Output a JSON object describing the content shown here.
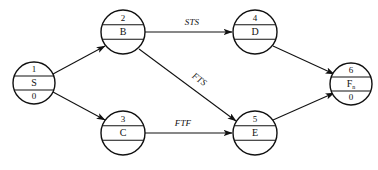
{
  "diagram": {
    "type": "precedence-network-diagram",
    "width": 378,
    "height": 170,
    "background_color": "#ffffff",
    "line_color": "#111111",
    "nodes": [
      {
        "id": "1",
        "name": "S",
        "duration": "0",
        "subscript": "",
        "cx": 34,
        "cy": 83,
        "r": 21
      },
      {
        "id": "2",
        "name": "B",
        "duration": "",
        "subscript": "",
        "cx": 123,
        "cy": 32,
        "r": 22
      },
      {
        "id": "3",
        "name": "C",
        "duration": "",
        "subscript": "",
        "cx": 123,
        "cy": 133,
        "r": 22
      },
      {
        "id": "4",
        "name": "D",
        "duration": "",
        "subscript": "",
        "cx": 255,
        "cy": 32,
        "r": 22
      },
      {
        "id": "5",
        "name": "E",
        "duration": "",
        "subscript": "",
        "cx": 255,
        "cy": 133,
        "r": 22
      },
      {
        "id": "6",
        "name": "F",
        "duration": "0",
        "subscript": "n",
        "cx": 351,
        "cy": 84,
        "r": 21
      }
    ],
    "edges": [
      {
        "from": "1",
        "to": "2",
        "label": "",
        "x1": 53,
        "y1": 74,
        "x2": 105,
        "y2": 46,
        "label_x": 0,
        "label_y": 0,
        "label_rotate": 0
      },
      {
        "from": "1",
        "to": "3",
        "label": "",
        "x1": 53,
        "y1": 92,
        "x2": 105,
        "y2": 120,
        "label_x": 0,
        "label_y": 0,
        "label_rotate": 0
      },
      {
        "from": "2",
        "to": "4",
        "label": "STS",
        "x1": 145,
        "y1": 32,
        "x2": 232,
        "y2": 32,
        "label_x": 192,
        "label_y": 23,
        "label_rotate": 0
      },
      {
        "from": "2",
        "to": "5",
        "label": "FTS",
        "x1": 139,
        "y1": 49,
        "x2": 236,
        "y2": 121,
        "label_x": 199,
        "label_y": 80,
        "label_rotate": 36
      },
      {
        "from": "3",
        "to": "5",
        "label": "FTF",
        "x1": 145,
        "y1": 133,
        "x2": 232,
        "y2": 133,
        "label_x": 183,
        "label_y": 124,
        "label_rotate": 0
      },
      {
        "from": "4",
        "to": "6",
        "label": "",
        "x1": 273,
        "y1": 46,
        "x2": 334,
        "y2": 74,
        "label_x": 0,
        "label_y": 0,
        "label_rotate": 0
      },
      {
        "from": "5",
        "to": "6",
        "label": "",
        "x1": 273,
        "y1": 120,
        "x2": 334,
        "y2": 93,
        "label_x": 0,
        "label_y": 0,
        "label_rotate": 0
      }
    ]
  }
}
